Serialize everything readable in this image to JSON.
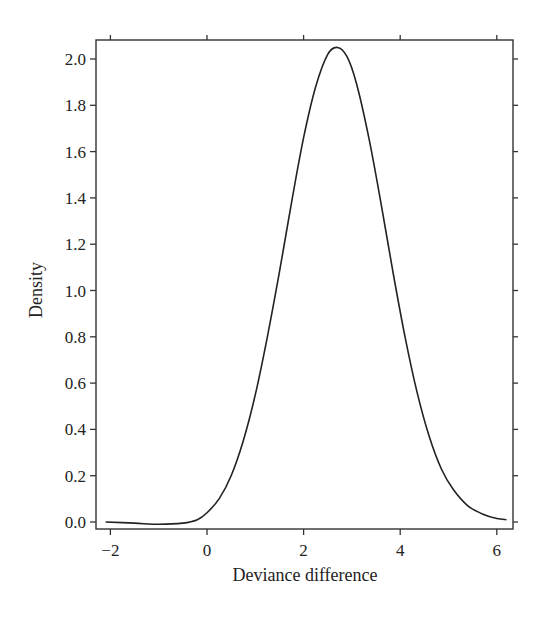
{
  "chart_data": {
    "type": "line",
    "title": "",
    "xlabel": "Deviance difference",
    "ylabel": "Density",
    "xlim": [
      -2.2,
      6.3
    ],
    "ylim": [
      -0.03,
      2.09
    ],
    "x_ticks": [
      -2,
      0,
      2,
      4,
      6
    ],
    "x_tick_labels": [
      "−2",
      "0",
      "2",
      "4",
      "6"
    ],
    "y_ticks": [
      0.0,
      0.2,
      0.4,
      0.6,
      0.8,
      1.0,
      1.2,
      1.4,
      1.6,
      1.8,
      2.0
    ],
    "y_tick_labels": [
      "0.0",
      "0.2",
      "0.4",
      "0.6",
      "0.8",
      "1.0",
      "1.2",
      "1.4",
      "1.6",
      "1.8",
      "2.0"
    ],
    "grid": false,
    "legend": null,
    "series": [
      {
        "name": "density",
        "color": "#222222",
        "x": [
          -2.1,
          -1.5,
          -1.0,
          -0.5,
          -0.2,
          0.0,
          0.25,
          0.5,
          0.75,
          1.0,
          1.25,
          1.5,
          1.75,
          2.0,
          2.25,
          2.5,
          2.7,
          2.9,
          3.1,
          3.35,
          3.6,
          3.85,
          4.1,
          4.35,
          4.6,
          4.85,
          5.1,
          5.4,
          5.7,
          6.0,
          6.2
        ],
        "y": [
          0.0,
          -0.005,
          -0.01,
          -0.005,
          0.01,
          0.04,
          0.1,
          0.2,
          0.35,
          0.55,
          0.8,
          1.08,
          1.38,
          1.66,
          1.88,
          2.02,
          2.05,
          2.01,
          1.89,
          1.66,
          1.38,
          1.08,
          0.8,
          0.56,
          0.37,
          0.23,
          0.14,
          0.07,
          0.035,
          0.015,
          0.01
        ]
      }
    ]
  }
}
